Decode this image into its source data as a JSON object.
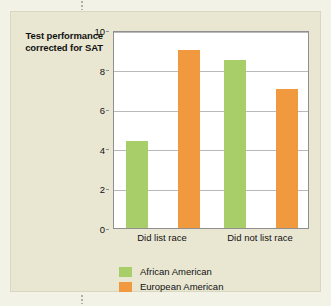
{
  "figure": {
    "panel_background": "#e9e7d2",
    "page_background": "#f3f2e6"
  },
  "chart_data": {
    "type": "bar",
    "title": "",
    "xlabel": "",
    "ylabel": "Test performance corrected for SAT",
    "categories": [
      "Did list race",
      "Did not list race"
    ],
    "series": [
      {
        "name": "African American",
        "color": "#a8ce6a",
        "values": [
          4.4,
          8.5
        ]
      },
      {
        "name": "European American",
        "color": "#f0993e",
        "values": [
          9.0,
          7.0
        ]
      }
    ],
    "ylim": [
      0,
      10
    ],
    "yticks": [
      0,
      2,
      4,
      6,
      8,
      10
    ],
    "ytick_labels": [
      "0",
      "2",
      "4",
      "6",
      "8",
      "10"
    ],
    "grid": true,
    "legend_position": "bottom-left"
  }
}
